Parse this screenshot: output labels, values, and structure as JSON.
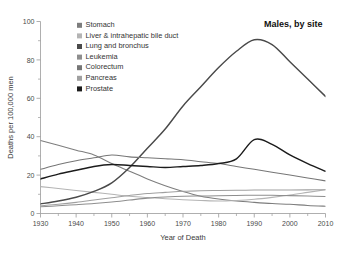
{
  "chart_data": {
    "type": "line",
    "title": "Males, by site",
    "xlabel": "Year of Death",
    "ylabel": "Deaths per 100,000 men",
    "xlim": [
      1930,
      2010
    ],
    "ylim": [
      0,
      100
    ],
    "xticks": [
      1930,
      1940,
      1950,
      1960,
      1970,
      1980,
      1990,
      2000,
      2010
    ],
    "yticks": [
      0,
      20,
      40,
      60,
      80,
      100
    ],
    "grid": false,
    "legend_position": "upper-left-inside",
    "x": [
      1930,
      1935,
      1940,
      1945,
      1950,
      1955,
      1960,
      1965,
      1970,
      1975,
      1980,
      1985,
      1990,
      1995,
      2000,
      2005,
      2010
    ],
    "series": [
      {
        "name": "Stomach",
        "color": "#7d7d7d",
        "values": [
          38.0,
          35.5,
          33.0,
          30.5,
          26.0,
          22.0,
          18.0,
          14.5,
          11.5,
          9.0,
          7.5,
          6.5,
          5.8,
          5.2,
          4.8,
          4.2,
          3.8
        ]
      },
      {
        "name": "Liver & intrahepatic bile duct",
        "color": "#b4b4b4",
        "values": [
          14.0,
          13.0,
          12.0,
          11.0,
          10.0,
          9.0,
          8.3,
          7.7,
          7.2,
          6.8,
          6.5,
          6.8,
          7.4,
          8.4,
          9.6,
          11.0,
          12.4
        ]
      },
      {
        "name": "Lung and bronchus",
        "color": "#4a4a4a",
        "values": [
          5.0,
          6.5,
          8.5,
          11.5,
          16.0,
          24.0,
          34.0,
          44.0,
          56.0,
          66.0,
          76.0,
          84.5,
          90.5,
          88.0,
          79.0,
          70.0,
          61.0
        ]
      },
      {
        "name": "Leukemia",
        "color": "#8e8e8e",
        "values": [
          3.5,
          4.0,
          4.6,
          5.2,
          6.0,
          7.0,
          8.0,
          8.6,
          9.0,
          9.1,
          9.2,
          9.4,
          9.5,
          9.5,
          9.3,
          9.1,
          8.9
        ]
      },
      {
        "name": "Colorectum",
        "color": "#767676",
        "values": [
          23.0,
          25.5,
          27.5,
          29.0,
          30.5,
          29.5,
          29.0,
          28.5,
          28.0,
          27.0,
          26.0,
          24.5,
          23.0,
          21.5,
          20.0,
          18.5,
          17.0
        ]
      },
      {
        "name": "Pancreas",
        "color": "#a0a0a0",
        "values": [
          4.0,
          4.8,
          5.8,
          7.0,
          8.2,
          9.4,
          10.4,
          11.0,
          11.6,
          11.9,
          12.0,
          12.1,
          12.2,
          12.2,
          12.2,
          12.3,
          12.4
        ]
      },
      {
        "name": "Prostate",
        "color": "#1c1c1c",
        "values": [
          18.0,
          20.5,
          22.5,
          24.5,
          25.5,
          25.0,
          24.5,
          24.0,
          24.5,
          25.0,
          26.0,
          28.5,
          38.5,
          36.0,
          30.5,
          26.0,
          22.0
        ]
      }
    ]
  },
  "legend": {
    "items": [
      {
        "label": "Stomach",
        "swatch": "#7d7d7d"
      },
      {
        "label": "Liver & intrahepatic bile duct",
        "swatch": "#b4b4b4"
      },
      {
        "label": "Lung and bronchus",
        "swatch": "#4a4a4a"
      },
      {
        "label": "Leukemia",
        "swatch": "#8e8e8e"
      },
      {
        "label": "Colorectum",
        "swatch": "#767676"
      },
      {
        "label": "Pancreas",
        "swatch": "#a0a0a0"
      },
      {
        "label": "Prostate",
        "swatch": "#1c1c1c"
      }
    ]
  },
  "axis_tick_labels": {
    "x": [
      "1930",
      "1940",
      "1950",
      "1960",
      "1970",
      "1980",
      "1990",
      "2000",
      "2010"
    ],
    "y": [
      "0",
      "20",
      "40",
      "60",
      "80",
      "100"
    ]
  }
}
